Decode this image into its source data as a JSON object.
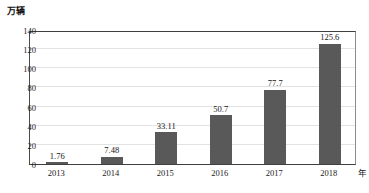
{
  "chart_data": {
    "type": "bar",
    "title": "",
    "subtitle": "",
    "xlabel": "年",
    "ylabel": "万辆",
    "categories": [
      "2013",
      "2014",
      "2015",
      "2016",
      "2017",
      "2018"
    ],
    "values": [
      1.76,
      7.48,
      33.11,
      50.7,
      77.7,
      125.6
    ],
    "value_labels": [
      "1.76",
      "7.48",
      "33.11",
      "50.7",
      "77.7",
      "125.6"
    ],
    "ylim": [
      0,
      140
    ],
    "yticks": [
      0,
      20,
      40,
      60,
      80,
      100,
      120,
      140
    ],
    "ytick_labels": [
      "0",
      "20",
      "40",
      "60",
      "80",
      "100",
      "120",
      "140"
    ],
    "grid": true,
    "grid_axis": "y",
    "legend": false,
    "legend_position": "none",
    "series": [
      {
        "name": "",
        "values": [
          1.76,
          7.48,
          33.11,
          50.7,
          77.7,
          125.6
        ],
        "color": "#595959"
      }
    ],
    "colors": {
      "bar": "#595959",
      "gridline": "#e2e2e2",
      "axis": "#3f3f3f",
      "text": "#1a1a1a",
      "background": "#ffffff"
    }
  }
}
